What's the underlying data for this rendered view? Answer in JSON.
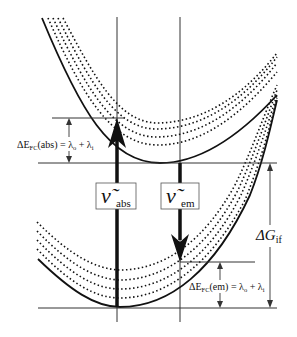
{
  "diagram": {
    "type": "potential-energy-surfaces",
    "colors": {
      "ink": "#111111",
      "thin": "#555555",
      "background": "#ffffff"
    },
    "labels": {
      "abs_nu": "ν̃",
      "abs_sub": "abs",
      "em_nu": "ν̃",
      "em_sub": "em",
      "dg_main": "ΔG",
      "dg_sub": "if",
      "efc_abs_pre": "ΔE",
      "efc_abs_sub": "FC",
      "efc_abs_post": "(abs) = λ",
      "efc_abs_o": "o",
      "efc_abs_plus": " + λ",
      "efc_abs_i": "i",
      "efc_em_pre": "ΔE",
      "efc_em_sub": "FC",
      "efc_em_post": "(em) = λ",
      "efc_em_o": "o",
      "efc_em_plus": " + λ",
      "efc_em_i": "i"
    },
    "surfaces": [
      {
        "name": "upper-state-surface",
        "minimum_y": 163,
        "vibrational_levels": 4
      },
      {
        "name": "lower-state-surface",
        "minimum_y": 307,
        "vibrational_levels": 4
      }
    ],
    "transitions": [
      {
        "name": "absorption",
        "direction": "up"
      },
      {
        "name": "emission",
        "direction": "down"
      }
    ]
  }
}
